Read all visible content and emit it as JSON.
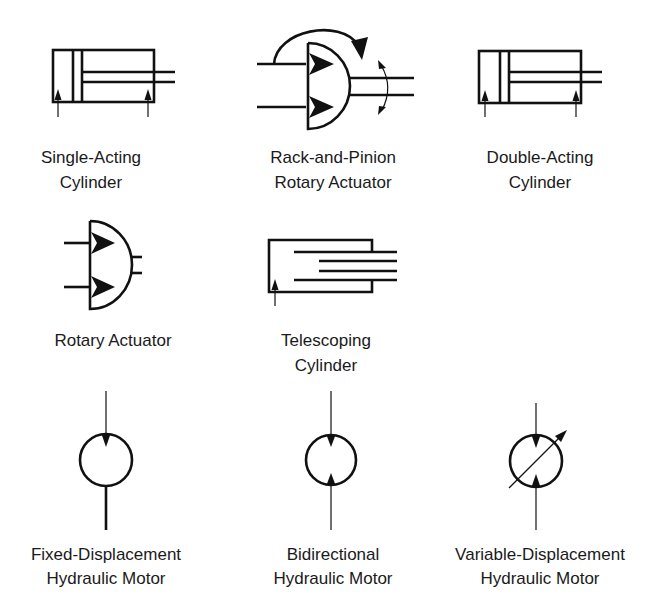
{
  "symbols": [
    {
      "id": "single-acting-cylinder",
      "label_lines": [
        "Single-Acting",
        "Cylinder"
      ]
    },
    {
      "id": "rack-and-pinion-rotary-actuator",
      "label_lines": [
        "Rack-and-Pinion",
        "Rotary Actuator"
      ]
    },
    {
      "id": "double-acting-cylinder",
      "label_lines": [
        "Double-Acting",
        "Cylinder"
      ]
    },
    {
      "id": "rotary-actuator",
      "label_lines": [
        "Rotary Actuator"
      ]
    },
    {
      "id": "telescoping-cylinder",
      "label_lines": [
        "Telescoping",
        "Cylinder"
      ]
    },
    {
      "id": "fixed-displacement-hydraulic-motor",
      "label_lines": [
        "Fixed-Displacement",
        "Hydraulic Motor"
      ]
    },
    {
      "id": "bidirectional-hydraulic-motor",
      "label_lines": [
        "Bidirectional",
        "Hydraulic Motor"
      ]
    },
    {
      "id": "variable-displacement-hydraulic-motor",
      "label_lines": [
        "Variable-Displacement",
        "Hydraulic Motor"
      ]
    }
  ],
  "colors": {
    "ink": "#111111",
    "label": "#1a1a1a",
    "background": "#ffffff"
  }
}
